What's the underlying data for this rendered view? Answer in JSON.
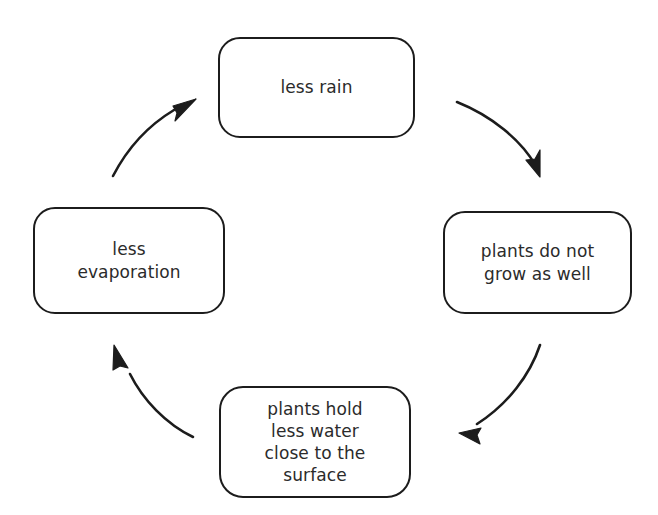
{
  "diagram": {
    "type": "cycle",
    "title": "",
    "background_color": "#ffffff",
    "stroke_color": "#1c1c1c",
    "text_color": "#2b2b2b",
    "nodes": [
      {
        "id": "less-rain",
        "label": "less rain",
        "position": "top"
      },
      {
        "id": "plants-do-not-grow-as-well",
        "label": "plants do not\ngrow as well",
        "position": "right"
      },
      {
        "id": "plants-hold-less-water-close-to-the-surface",
        "label": "plants hold\nless water\nclose to the\nsurface",
        "position": "bottom"
      },
      {
        "id": "less-evaporation",
        "label": "less\nevaporation",
        "position": "left"
      }
    ],
    "arrows": [
      {
        "id": "arrow-top-to-right",
        "from": "less-rain",
        "to": "plants-do-not-grow-as-well",
        "direction": "clockwise"
      },
      {
        "id": "arrow-right-to-bottom",
        "from": "plants-do-not-grow-as-well",
        "to": "plants-hold-less-water-close-to-the-surface",
        "direction": "clockwise"
      },
      {
        "id": "arrow-bottom-to-left",
        "from": "plants-hold-less-water-close-to-the-surface",
        "to": "less-evaporation",
        "direction": "clockwise"
      },
      {
        "id": "arrow-left-to-top",
        "from": "less-evaporation",
        "to": "less-rain",
        "direction": "clockwise"
      }
    ]
  }
}
